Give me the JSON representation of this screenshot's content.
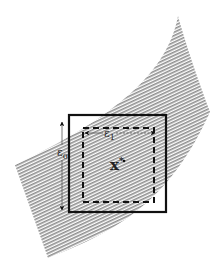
{
  "diagram": {
    "labels": {
      "point": "x*",
      "point_base": "x",
      "point_sup": "*",
      "vertical_tolerance": "ε",
      "vertical_tolerance_sub": "0",
      "horizontal_tolerance": "ε",
      "horizontal_tolerance_sub": "1"
    },
    "colors": {
      "band_hatch": "#9a9a9a",
      "stroke": "#111111",
      "background": "#ffffff"
    },
    "elements": {
      "band": "curved hatched region",
      "outer_box": "solid square",
      "inner_box": "dashed square"
    }
  }
}
